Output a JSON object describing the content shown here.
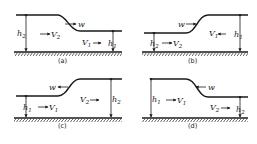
{
  "figure": {
    "panels": [
      {
        "id": "a",
        "caption": "(a)",
        "left": {
          "depth_label": "h",
          "depth_sub": "2",
          "velocity_label": "V",
          "velocity_sub": "2",
          "velocity_dir": "right",
          "level": "high"
        },
        "right": {
          "depth_label": "h",
          "depth_sub": "1",
          "velocity_label": "V",
          "velocity_sub": "1",
          "velocity_dir": "right",
          "level": "low"
        },
        "wave": {
          "label": "w",
          "dir": "right"
        }
      },
      {
        "id": "b",
        "caption": "(b)",
        "left": {
          "depth_label": "h",
          "depth_sub": "2",
          "velocity_label": "V",
          "velocity_sub": "2",
          "velocity_dir": "right",
          "level": "low"
        },
        "right": {
          "depth_label": "h",
          "depth_sub": "1",
          "velocity_label": "V",
          "velocity_sub": "1",
          "velocity_dir": "left",
          "level": "high"
        },
        "wave": {
          "label": "w",
          "dir": "right"
        }
      },
      {
        "id": "c",
        "caption": "(c)",
        "left": {
          "depth_label": "h",
          "depth_sub": "1",
          "velocity_label": "V",
          "velocity_sub": "1",
          "velocity_dir": "right",
          "level": "low"
        },
        "right": {
          "depth_label": "h",
          "depth_sub": "2",
          "velocity_label": "V",
          "velocity_sub": "2",
          "velocity_dir": "right",
          "level": "high"
        },
        "wave": {
          "label": "w",
          "dir": "left"
        }
      },
      {
        "id": "d",
        "caption": "(d)",
        "left": {
          "depth_label": "h",
          "depth_sub": "1",
          "velocity_label": "V",
          "velocity_sub": "1",
          "velocity_dir": "right",
          "level": "high"
        },
        "right": {
          "depth_label": "h",
          "depth_sub": "2",
          "velocity_label": "V",
          "velocity_sub": "2",
          "velocity_dir": "right",
          "level": "low"
        },
        "wave": {
          "label": "w",
          "dir": "left"
        }
      }
    ]
  }
}
